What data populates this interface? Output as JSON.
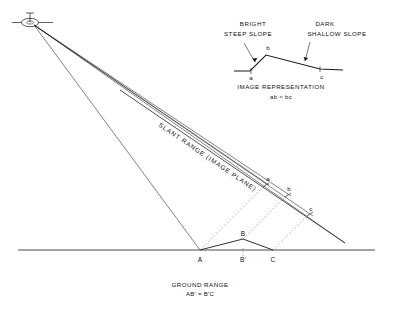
{
  "figure": {
    "type": "diagram",
    "background_color": "#ffffff",
    "line_color": "#1a1a1a",
    "dashed_color": "#777777"
  },
  "main_diagram": {
    "platform": {
      "icon_name": "aircraft-icon",
      "x": 30,
      "y": 22
    },
    "slant_range_label": "SLANT RANGE (IMAGE PLANE)",
    "slant_points": [
      {
        "label": "a",
        "x": 268,
        "y": 181
      },
      {
        "label": "b",
        "x": 289,
        "y": 191
      },
      {
        "label": "c",
        "x": 311,
        "y": 211
      }
    ],
    "ground_points": [
      {
        "label": "A",
        "x": 200,
        "y": 262
      },
      {
        "label": "B",
        "x": 243,
        "y": 236
      },
      {
        "label": "B'",
        "x": 243,
        "y": 262
      },
      {
        "label": "C",
        "x": 273,
        "y": 262
      }
    ],
    "ground_caption_line1": "GROUND RANGE",
    "ground_caption_line2": "AB' = B'C"
  },
  "inset_diagram": {
    "annotations": [
      {
        "name": "bright-steep-slope",
        "line1": "BRIGHT",
        "line2": "STEEP SLOPE"
      },
      {
        "name": "dark-shallow-slope",
        "line1": "DARK",
        "line2": "SHALLOW SLOPE"
      }
    ],
    "profile_points": [
      {
        "label": "a",
        "x": 251,
        "y": 70
      },
      {
        "label": "b",
        "x": 268,
        "y": 49
      },
      {
        "label": "c",
        "x": 323,
        "y": 71
      }
    ],
    "caption_line1": "IMAGE REPRESENTATION",
    "caption_line2": "ab < bc"
  }
}
